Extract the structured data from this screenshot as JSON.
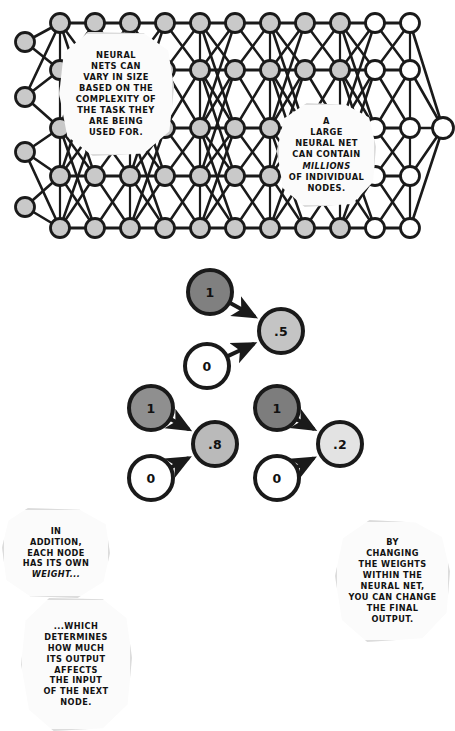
{
  "comic": {
    "title": "Neural network size and node weights",
    "panels": [
      "network-diagram",
      "weights-diagram"
    ]
  },
  "palette": {
    "node_gray": "#c9c9c9",
    "node_white": "#ffffff",
    "node_dark": "#808080",
    "node_mid": "#c0c0c0",
    "node_mid_dark": "#b5b5b5",
    "node_light": "#e2e2e2",
    "stroke": "#1a1a1a",
    "callout_fill": "#fbfbfb",
    "callout_border": "#dcdcdc",
    "background": "#ffffff"
  },
  "network": {
    "rows": 5,
    "columns": 11,
    "input_column_nodes": 5,
    "output_node_count": 1,
    "row_y": [
      23,
      70,
      128,
      176,
      228
    ],
    "col_x": [
      60,
      95,
      130,
      165,
      200,
      235,
      270,
      305,
      340,
      375,
      410
    ],
    "input_x": 25,
    "input_y": [
      42,
      97,
      152,
      207
    ],
    "output_x": 443,
    "output_y": 128,
    "node_radius": 9.5
  },
  "callouts": [
    {
      "id": "netsize",
      "name": "callout-network-size",
      "lines": [
        "NEURAL",
        "NETS CAN",
        "VARY IN SIZE",
        "BASED ON THE",
        "COMPLEXITY OF",
        "THE TASK THEY",
        "ARE BEING",
        "USED FOR."
      ],
      "emphasis": []
    },
    {
      "id": "millions",
      "name": "callout-millions-of-nodes",
      "lines": [
        "A",
        "LARGE",
        "NEURAL NET",
        "CAN CONTAIN",
        "MILLIONS",
        "OF INDIVIDUAL",
        "NODES."
      ],
      "emphasis": [
        "MILLIONS"
      ]
    },
    {
      "id": "addition",
      "name": "callout-each-node-weight",
      "lines": [
        "IN",
        "ADDITION,",
        "EACH NODE",
        "HAS ITS OWN",
        "WEIGHT..."
      ],
      "emphasis": [
        "WEIGHT..."
      ]
    },
    {
      "id": "which",
      "name": "callout-which-determines",
      "lines": [
        "...WHICH",
        "DETERMINES",
        "HOW MUCH",
        "ITS OUTPUT",
        "AFFECTS",
        "THE INPUT",
        "OF THE NEXT",
        "NODE."
      ],
      "emphasis": []
    },
    {
      "id": "changing",
      "name": "callout-changing-weights",
      "lines": [
        "BY",
        "CHANGING",
        "THE WEIGHTS",
        "WITHIN THE",
        "NEURAL NET,",
        "YOU CAN CHANGE",
        "THE FINAL",
        "OUTPUT."
      ],
      "emphasis": [
        "WEIGHTS"
      ]
    }
  ],
  "weight_clusters": [
    {
      "name": "cluster-point-five",
      "inputs": [
        {
          "value": "1",
          "fill": "#808080",
          "cx": 210,
          "cy": 292,
          "r": 22
        },
        {
          "value": "0",
          "fill": "#ffffff",
          "cx": 207,
          "cy": 366,
          "r": 22
        }
      ],
      "output": {
        "value": ".5",
        "fill": "#c4c4c4",
        "cx": 281,
        "cy": 331,
        "r": 22
      }
    },
    {
      "name": "cluster-point-eight",
      "inputs": [
        {
          "value": "1",
          "fill": "#8f8f8f",
          "cx": 151,
          "cy": 408,
          "r": 22
        },
        {
          "value": "0",
          "fill": "#ffffff",
          "cx": 151,
          "cy": 478,
          "r": 22
        }
      ],
      "output": {
        "value": ".8",
        "fill": "#bababa",
        "cx": 215,
        "cy": 444,
        "r": 22
      }
    },
    {
      "name": "cluster-point-two",
      "inputs": [
        {
          "value": "1",
          "fill": "#7d7d7d",
          "cx": 277,
          "cy": 408,
          "r": 22
        },
        {
          "value": "0",
          "fill": "#ffffff",
          "cx": 277,
          "cy": 478,
          "r": 22
        }
      ],
      "output": {
        "value": ".2",
        "fill": "#e3e3e3",
        "cx": 340,
        "cy": 444,
        "r": 22
      }
    }
  ]
}
